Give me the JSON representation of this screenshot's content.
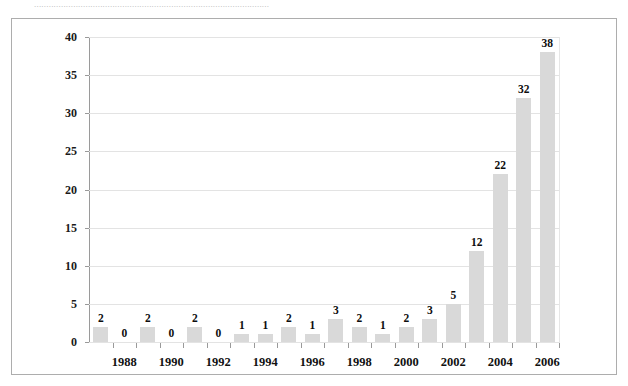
{
  "caption": {
    "text": "................................................................................................"
  },
  "chart_data": {
    "type": "bar",
    "title": "",
    "subtitle": "",
    "xlabel": "",
    "ylabel": "",
    "categories": [
      "1987",
      "1988",
      "1989",
      "1990",
      "1991",
      "1992",
      "1993",
      "1994",
      "1995",
      "1996",
      "1997",
      "1998",
      "1999",
      "2000",
      "2001",
      "2002",
      "2003",
      "2004",
      "2005",
      "2006"
    ],
    "values": [
      2,
      0,
      2,
      0,
      2,
      0,
      1,
      1,
      2,
      1,
      3,
      2,
      1,
      2,
      3,
      5,
      12,
      22,
      32,
      38
    ],
    "data_labels": [
      "2",
      "0",
      "2",
      "0",
      "2",
      "0",
      "1",
      "1",
      "2",
      "1",
      "3",
      "2",
      "1",
      "2",
      "3",
      "5",
      "12",
      "22",
      "32",
      "38"
    ],
    "visible_x_tick_labels": [
      "1988",
      "1990",
      "1992",
      "1994",
      "1996",
      "1998",
      "2000",
      "2002",
      "2004",
      "2006"
    ],
    "ylim": [
      0,
      40
    ],
    "ytick_step": 5,
    "ytick_labels": [
      "0",
      "5",
      "10",
      "15",
      "20",
      "25",
      "30",
      "35",
      "40"
    ],
    "grid": true,
    "grid_axis": "y",
    "legend": "none",
    "bar_color": "#d9d9d9",
    "axis_color": "#9a9a9a",
    "grid_color": "#e3e3e3",
    "label_color": "#111111",
    "frame_color": "#adadad",
    "background": "#ffffff"
  }
}
